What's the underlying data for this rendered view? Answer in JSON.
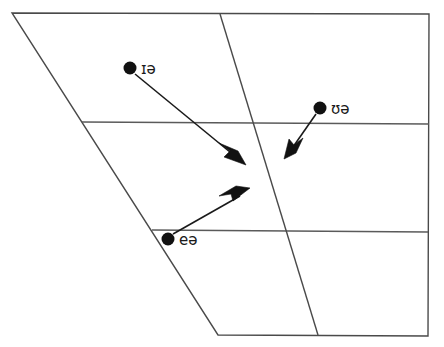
{
  "figure": {
    "width": 444,
    "height": 347,
    "background_color": "#ffffff",
    "line_color": "#4a4a4a",
    "ink_color": "#111111"
  },
  "quadrilateral": {
    "name": "vowel-quadrilateral-outline",
    "points": "12,13 429,14 428,336 218,335",
    "corners": {
      "top_left": [
        12,
        13
      ],
      "top_right": [
        429,
        14
      ],
      "bottom_right": [
        428,
        336
      ],
      "bottom_left": [
        218,
        335
      ]
    }
  },
  "grid_lines": [
    {
      "name": "close-mid-line",
      "x1": 82,
      "y1": 122,
      "x2": 429,
      "y2": 124
    },
    {
      "name": "open-mid-line",
      "x1": 152,
      "y1": 230,
      "x2": 428,
      "y2": 232
    }
  ],
  "divider": {
    "name": "central-divider-line",
    "x1": 220,
    "y1": 14,
    "x2": 318,
    "y2": 335
  },
  "diphthongs": [
    {
      "id": "near",
      "label": "ɪə",
      "dot": {
        "x": 130,
        "y": 68,
        "r": 6.5
      },
      "label_pos": {
        "x": 141,
        "y": 74
      },
      "arrow": {
        "x1": 135,
        "y1": 74,
        "x2": 243,
        "y2": 163
      }
    },
    {
      "id": "cure",
      "label": "ʊə",
      "dot": {
        "x": 320,
        "y": 108,
        "r": 6.5
      },
      "label_pos": {
        "x": 331,
        "y": 114
      },
      "arrow": {
        "x1": 316,
        "y1": 114,
        "x2": 286,
        "y2": 157
      }
    },
    {
      "id": "square",
      "label": "eə",
      "dot": {
        "x": 168,
        "y": 239,
        "r": 6.5
      },
      "label_pos": {
        "x": 179,
        "y": 245
      },
      "arrow": {
        "x1": 173,
        "y1": 234,
        "x2": 248,
        "y2": 189
      }
    }
  ]
}
